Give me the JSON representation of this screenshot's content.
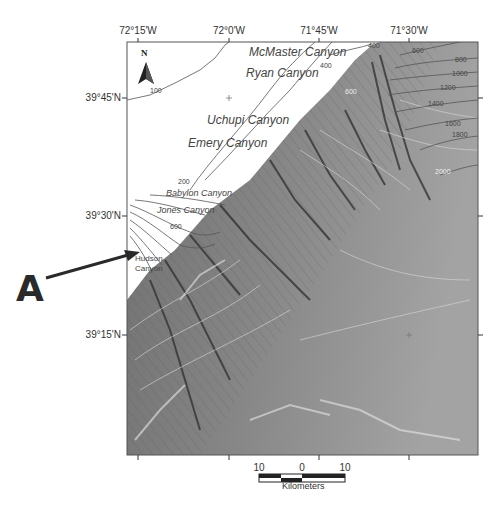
{
  "map": {
    "title": "",
    "longitude_ticks": [
      {
        "label": "72°15'W",
        "x": 138
      },
      {
        "label": "72°0'W",
        "x": 229
      },
      {
        "label": "71°45'W",
        "x": 319
      },
      {
        "label": "71°30'W",
        "x": 409
      }
    ],
    "latitude_ticks": [
      {
        "label": "39°45'N",
        "y": 98
      },
      {
        "label": "39°30'N",
        "y": 216
      },
      {
        "label": "39°15'N",
        "y": 335
      }
    ],
    "north_arrow": {
      "label": "N"
    },
    "canyons": [
      {
        "name": "McMaster Canyon",
        "x": 249,
        "y": 52,
        "size": 12
      },
      {
        "name": "Ryan Canyon",
        "x": 246,
        "y": 72,
        "size": 12
      },
      {
        "name": "Uchupi Canyon",
        "x": 207,
        "y": 120,
        "size": 12
      },
      {
        "name": "Emery Canyon",
        "x": 188,
        "y": 143,
        "size": 12
      },
      {
        "name": "Babylon Canyon",
        "x": 165,
        "y": 193,
        "size": 9
      },
      {
        "name": "Jones Canyon",
        "x": 157,
        "y": 209,
        "size": 9
      },
      {
        "name": "Hudson",
        "x": 134,
        "y": 259,
        "size": 8
      },
      {
        "name": "Canyon",
        "x": 134,
        "y": 268,
        "size": 8
      }
    ],
    "contour_labels": [
      {
        "label": "100",
        "x": 150,
        "y": 92
      },
      {
        "label": "400",
        "x": 368,
        "y": 46
      },
      {
        "label": "600",
        "x": 412,
        "y": 52
      },
      {
        "label": "800",
        "x": 455,
        "y": 60
      },
      {
        "label": "1000",
        "x": 452,
        "y": 74
      },
      {
        "label": "1200",
        "x": 440,
        "y": 88
      },
      {
        "label": "1400",
        "x": 428,
        "y": 104
      },
      {
        "label": "1600",
        "x": 445,
        "y": 124
      },
      {
        "label": "1800",
        "x": 452,
        "y": 135
      },
      {
        "label": "2000",
        "x": 435,
        "y": 172
      },
      {
        "label": "400",
        "x": 320,
        "y": 66
      },
      {
        "label": "600",
        "x": 345,
        "y": 92
      },
      {
        "label": "200",
        "x": 178,
        "y": 182
      },
      {
        "label": "600",
        "x": 170,
        "y": 227
      },
      {
        "label": "400",
        "x": 210,
        "y": 200
      }
    ],
    "annotation": {
      "label": "A"
    },
    "scale_bar": {
      "ticks": [
        "10",
        "0",
        "10"
      ],
      "unit": "Kilometers"
    }
  },
  "colors": {
    "frame": "#555555",
    "land_bg": "#ffffff",
    "seafloor_dark": "#6e6e6e",
    "seafloor_mid": "#8c8c8c",
    "seafloor_light": "#a5a5a5",
    "contour_land": "#555555",
    "contour_sea": "#d8d8d8"
  }
}
